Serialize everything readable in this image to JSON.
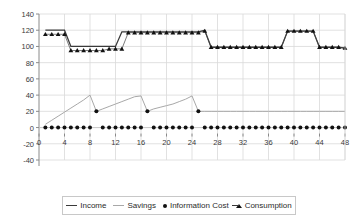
{
  "chart_data": {
    "type": "line",
    "title": "",
    "xlabel": "",
    "ylabel": "",
    "xlim": [
      0,
      48
    ],
    "ylim": [
      -40,
      140
    ],
    "xticks": [
      0,
      4,
      8,
      12,
      16,
      20,
      24,
      28,
      32,
      36,
      40,
      44,
      48
    ],
    "yticks": [
      -40,
      -20,
      0,
      20,
      40,
      60,
      80,
      100,
      120,
      140
    ],
    "grid": true,
    "legend_position": "bottom",
    "x": [
      1,
      2,
      3,
      4,
      5,
      6,
      7,
      8,
      9,
      10,
      11,
      12,
      13,
      14,
      15,
      16,
      17,
      18,
      19,
      20,
      21,
      22,
      23,
      24,
      25,
      26,
      27,
      28,
      29,
      30,
      31,
      32,
      33,
      34,
      35,
      36,
      37,
      38,
      39,
      40,
      41,
      42,
      43,
      44,
      45,
      46,
      47,
      48
    ],
    "series": [
      {
        "name": "Income",
        "style": "line",
        "color": "#3a3a3a",
        "values": [
          120,
          120,
          120,
          120,
          100,
          100,
          100,
          100,
          100,
          100,
          100,
          100,
          118,
          118,
          118,
          118,
          118,
          118,
          118,
          118,
          118,
          118,
          118,
          118,
          118,
          120,
          99,
          99,
          99,
          99,
          99,
          99,
          99,
          99,
          99,
          99,
          99,
          99,
          119,
          119,
          119,
          119,
          119,
          99,
          99,
          99,
          99,
          98
        ]
      },
      {
        "name": "Savings",
        "style": "line",
        "color": "#a8a8a8",
        "values": [
          4,
          9,
          14,
          19,
          24,
          29,
          34,
          40,
          20,
          23,
          26,
          29,
          32,
          35,
          38,
          39,
          20,
          23,
          25,
          27,
          29,
          32,
          35,
          39,
          20,
          20,
          20,
          20,
          20,
          20,
          20,
          20,
          20,
          20,
          20,
          20,
          20,
          20,
          20,
          20,
          20,
          20,
          20,
          20,
          20,
          20,
          20,
          20
        ]
      },
      {
        "name": "Information Cost",
        "style": "marker-dot",
        "color": "#111111",
        "values": [
          0,
          0,
          0,
          0,
          0,
          0,
          0,
          0,
          20,
          0,
          0,
          0,
          0,
          0,
          0,
          0,
          20,
          0,
          0,
          0,
          0,
          0,
          0,
          0,
          20,
          0,
          0,
          0,
          0,
          0,
          0,
          0,
          0,
          0,
          0,
          0,
          0,
          0,
          0,
          0,
          0,
          0,
          0,
          0,
          0,
          0,
          0,
          0
        ]
      },
      {
        "name": "Consumption",
        "style": "marker-triangle",
        "color": "#111111",
        "values": [
          115,
          115,
          115,
          115,
          95,
          95,
          95,
          95,
          95,
          95,
          97,
          97,
          97,
          117,
          117,
          117,
          117,
          117,
          117,
          117,
          117,
          117,
          117,
          117,
          117,
          119,
          99,
          99,
          99,
          99,
          99,
          99,
          99,
          99,
          99,
          99,
          99,
          99,
          119,
          119,
          119,
          119,
          119,
          99,
          99,
          99,
          99,
          98
        ]
      }
    ]
  },
  "legend": {
    "items": [
      {
        "label": "Income",
        "marker": "line-icon"
      },
      {
        "label": "Savings",
        "marker": "line-gray-icon"
      },
      {
        "label": "Information Cost",
        "marker": "dot-icon"
      },
      {
        "label": "Consumption",
        "marker": "triangle-line-icon"
      }
    ]
  }
}
